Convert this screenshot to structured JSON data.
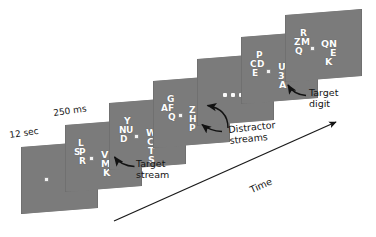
{
  "figure": {
    "type": "rsvp-attention-paradigm-diagram",
    "background": "#ffffff",
    "panel_color": "#7b7b7b",
    "letter_color": "#fdfdfd",
    "annotation_color": "#141414"
  },
  "durations": {
    "fixation": "12 sec",
    "frame": "250 ms"
  },
  "axis": {
    "time_label": "Time"
  },
  "annotations": {
    "target_stream": "Target\nstream",
    "distractor_streams": "Distractor\nstreams",
    "target_digit": "Target\ndigit"
  },
  "frames": [
    {
      "id": "frame-1",
      "duration_label": "12 sec",
      "has_fixation": true,
      "left_stream": [],
      "right_stream": []
    },
    {
      "id": "frame-2",
      "duration_label": "250 ms",
      "has_fixation": true,
      "left_stream": [
        "L",
        "S",
        "P",
        "R"
      ],
      "right_stream": [
        "V",
        "M",
        "A",
        "K"
      ]
    },
    {
      "id": "frame-3",
      "has_fixation": true,
      "left_stream": [
        "Y",
        "N",
        "U",
        "D"
      ],
      "right_stream": [
        "W",
        "C",
        "T",
        "S"
      ]
    },
    {
      "id": "frame-4",
      "has_fixation": true,
      "left_stream": [
        "G",
        "A",
        "F",
        "Q"
      ],
      "right_stream": [
        "Z",
        "H",
        "B",
        "P"
      ]
    },
    {
      "id": "frame-5",
      "has_fixation": false,
      "is_ellipsis": true,
      "ellipsis_dots": 3,
      "left_stream": [],
      "right_stream": []
    },
    {
      "id": "frame-6",
      "has_fixation": true,
      "left_stream": [
        "P",
        "C",
        "D",
        "E"
      ],
      "right_stream": [
        "U",
        "3",
        "K",
        "A"
      ],
      "target_digit": "3"
    },
    {
      "id": "frame-7",
      "has_fixation": true,
      "left_stream": [
        "R",
        "Z",
        "M",
        "Q"
      ],
      "right_stream": [
        "Q",
        "N",
        "E",
        "K"
      ]
    }
  ]
}
